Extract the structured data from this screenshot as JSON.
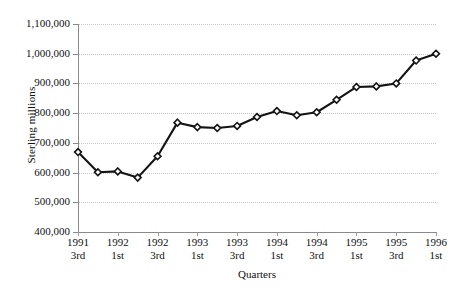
{
  "chart_data": {
    "type": "line",
    "title": "",
    "xlabel": "Quarters",
    "ylabel": "Sterling millions",
    "ylim": [
      400000,
      1100000
    ],
    "ytick_values": [
      1100000,
      1000000,
      900000,
      800000,
      700000,
      600000,
      500000,
      400000
    ],
    "ytick_labels": [
      "1,100,000",
      "1,000,000",
      "900,000",
      "800,000",
      "700,000",
      "600,000",
      "500,000",
      "400,000"
    ],
    "grid": true,
    "legend": "none",
    "marker": "diamond",
    "line_color": "#141414",
    "marker_fill": "#ffffff",
    "marker_edge": "#141414",
    "grid_color": "#c9c9c9",
    "axis_color": "#8a8a8a",
    "x_labels_every": 2,
    "x": [
      "1991 3rd",
      "1991 4th",
      "1992 1st",
      "1992 2nd",
      "1992 3rd",
      "1992 4th",
      "1993 1st",
      "1993 2nd",
      "1993 3rd",
      "1993 4th",
      "1994 1st",
      "1994 2nd",
      "1994 3rd",
      "1994 4th",
      "1995 1st",
      "1995 2nd",
      "1995 3rd",
      "1995 4th",
      "1996 1st"
    ],
    "x_tick_labels": [
      {
        "index": 0,
        "line1": "1991",
        "line2": "3rd"
      },
      {
        "index": 2,
        "line1": "1992",
        "line2": "1st"
      },
      {
        "index": 4,
        "line1": "1992",
        "line2": "3rd"
      },
      {
        "index": 6,
        "line1": "1993",
        "line2": "1st"
      },
      {
        "index": 8,
        "line1": "1993",
        "line2": "3rd"
      },
      {
        "index": 10,
        "line1": "1994",
        "line2": "1st"
      },
      {
        "index": 12,
        "line1": "1994",
        "line2": "3rd"
      },
      {
        "index": 14,
        "line1": "1995",
        "line2": "1st"
      },
      {
        "index": 16,
        "line1": "1995",
        "line2": "3rd"
      },
      {
        "index": 18,
        "line1": "1996",
        "line2": "1st"
      }
    ],
    "values": [
      669000,
      601000,
      604000,
      583000,
      655000,
      768000,
      753000,
      750000,
      757000,
      787000,
      807000,
      793000,
      803000,
      845000,
      888000,
      890000,
      900000,
      977000,
      1000000
    ]
  }
}
